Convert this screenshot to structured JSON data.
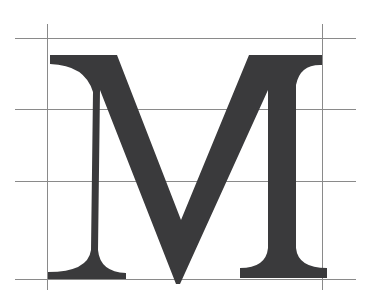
{
  "diagram": {
    "type": "letterform-construction",
    "glyph": "M",
    "style": "serif capital",
    "colors": {
      "background": "#ffffff",
      "glyph": "#3a3a3c",
      "guide_lines": "#8a8a8a"
    },
    "guides": {
      "horizontal": [
        {
          "name": "cap-height",
          "y": 38,
          "x1": 15,
          "x2": 356
        },
        {
          "name": "upper-guide",
          "y": 109,
          "x1": 15,
          "x2": 356
        },
        {
          "name": "middle-guide",
          "y": 181,
          "x1": 15,
          "x2": 356
        },
        {
          "name": "baseline",
          "y": 279,
          "x1": 15,
          "x2": 356
        }
      ],
      "vertical": [
        {
          "name": "left-sidebearing",
          "x": 47,
          "y1": 24,
          "y2": 290
        },
        {
          "name": "right-sidebearing",
          "x": 322,
          "y1": 24,
          "y2": 290
        }
      ]
    }
  }
}
